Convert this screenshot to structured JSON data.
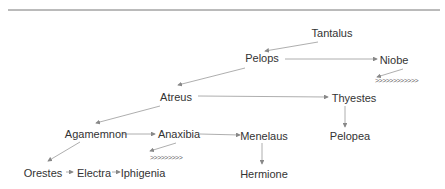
{
  "diagram": {
    "type": "family-tree",
    "colors": {
      "text": "#333333",
      "line": "#888888",
      "rule": "#777777"
    },
    "nodes": [
      {
        "id": "tantalus",
        "label": "Tantalus",
        "x": 332,
        "y": 33
      },
      {
        "id": "pelops",
        "label": "Pelops",
        "x": 262,
        "y": 58
      },
      {
        "id": "niobe",
        "label": "Niobe",
        "x": 392,
        "y": 60
      },
      {
        "id": "atreus",
        "label": "Atreus",
        "x": 176,
        "y": 97
      },
      {
        "id": "thyestes",
        "label": "Thyestes",
        "x": 354,
        "y": 98
      },
      {
        "id": "agamemnon",
        "label": "Agamemnon",
        "x": 96,
        "y": 134
      },
      {
        "id": "anaxibia",
        "label": "Anaxibia",
        "x": 179,
        "y": 134
      },
      {
        "id": "menelaus",
        "label": "Menelaus",
        "x": 263,
        "y": 136
      },
      {
        "id": "pelopea",
        "label": "Pelopea",
        "x": 350,
        "y": 136
      },
      {
        "id": "orestes",
        "label": "Orestes",
        "x": 45,
        "y": 173
      },
      {
        "id": "electra",
        "label": "Electra",
        "x": 94,
        "y": 173
      },
      {
        "id": "iphigenia",
        "label": "Iphigenia",
        "x": 134,
        "y": 173
      },
      {
        "id": "hermione",
        "label": "Hermione",
        "x": 262,
        "y": 174
      }
    ],
    "edges": [
      {
        "from": "tantalus",
        "to": "pelops"
      },
      {
        "from": "pelops",
        "to": "niobe"
      },
      {
        "from": "pelops",
        "to": "atreus"
      },
      {
        "from": "atreus",
        "to": "thyestes"
      },
      {
        "from": "atreus",
        "to": "agamemnon"
      },
      {
        "from": "agamemnon",
        "to": "anaxibia"
      },
      {
        "from": "anaxibia",
        "to": "menelaus"
      },
      {
        "from": "thyestes",
        "to": "pelopea"
      },
      {
        "from": "menelaus",
        "to": "hermione"
      },
      {
        "from": "agamemnon",
        "to": "orestes"
      },
      {
        "from": "orestes",
        "to": "electra"
      },
      {
        "from": "electra",
        "to": "iphigenia"
      }
    ],
    "chevron_chains": [
      {
        "id": "niobe-children",
        "text": ">>>>>>>>>>>>",
        "x": 375,
        "y": 77
      },
      {
        "id": "anaxibia-children",
        "text": ">>>>>>>>>",
        "x": 150,
        "y": 154
      }
    ]
  }
}
